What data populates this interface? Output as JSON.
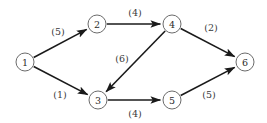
{
  "figure": {
    "background_color": "#ffffff",
    "node_stroke_color": "#5a5a5a",
    "edge_color": "#1a1a1a",
    "label_color": "#2b2b2b",
    "width": 267,
    "height": 123
  },
  "graph_data": {
    "type": "directed-weighted-graph",
    "node_count": 6,
    "edge_count": 7,
    "nodes": [
      {
        "id": "1",
        "label": "1",
        "x": 25,
        "y": 62,
        "r": 9
      },
      {
        "id": "2",
        "label": "2",
        "x": 97,
        "y": 24,
        "r": 9
      },
      {
        "id": "3",
        "label": "3",
        "x": 98,
        "y": 100,
        "r": 9
      },
      {
        "id": "4",
        "label": "4",
        "x": 172,
        "y": 24,
        "r": 9
      },
      {
        "id": "5",
        "label": "5",
        "x": 172,
        "y": 100,
        "r": 9
      },
      {
        "id": "6",
        "label": "6",
        "x": 245,
        "y": 62,
        "r": 9
      }
    ],
    "edges": [
      {
        "id": "e-1-2",
        "from": "1",
        "to": "2",
        "weight": 5,
        "label": "(5)",
        "label_x": 58,
        "label_y": 31
      },
      {
        "id": "e-1-3",
        "from": "1",
        "to": "3",
        "weight": 1,
        "label": "(1)",
        "label_x": 60,
        "label_y": 94
      },
      {
        "id": "e-2-4",
        "from": "2",
        "to": "4",
        "weight": 4,
        "label": "(4)",
        "label_x": 135,
        "label_y": 12
      },
      {
        "id": "e-4-3",
        "from": "4",
        "to": "3",
        "weight": 6,
        "label": "(6)",
        "label_x": 122,
        "label_y": 58
      },
      {
        "id": "e-4-6",
        "from": "4",
        "to": "6",
        "weight": 2,
        "label": "(2)",
        "label_x": 211,
        "label_y": 27
      },
      {
        "id": "e-3-5",
        "from": "3",
        "to": "5",
        "weight": 4,
        "label": "(4)",
        "label_x": 135,
        "label_y": 113
      },
      {
        "id": "e-5-6",
        "from": "5",
        "to": "6",
        "weight": 5,
        "label": "(5)",
        "label_x": 209,
        "label_y": 94
      }
    ]
  }
}
